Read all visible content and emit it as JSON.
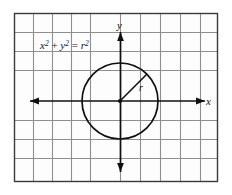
{
  "figure": {
    "background_color": "#fdfdfd",
    "frame": {
      "border_color": "#3a3a3a",
      "x": 14,
      "y": 13,
      "width": 204,
      "height": 169
    },
    "grid": {
      "color": "#8e8e8e",
      "cell_size": 19,
      "columns": 10,
      "rows": 9,
      "visible": true
    },
    "axes": {
      "color": "#101010",
      "x_label": "x",
      "y_label": "y",
      "x_arrow_left": true,
      "x_arrow_right": true,
      "y_arrow_up": true,
      "y_arrow_down": true,
      "origin_x": 120,
      "origin_y": 101
    },
    "equation": {
      "base_x": "x",
      "exp_x": "2",
      "plus": " + ",
      "base_y": "y",
      "exp_y": "2",
      "equals": " = ",
      "base_r": "r",
      "exp_r": "2",
      "full_text": "x2 + y2 = r2"
    },
    "circle": {
      "center_x": 120,
      "center_y": 101,
      "radius": 38,
      "stroke_color": "#101010",
      "fill": "none"
    },
    "radius_segment": {
      "from_x": 120,
      "from_y": 101,
      "to_x": 147,
      "to_y": 74,
      "label": "r",
      "label_x": 139,
      "label_y": 90,
      "color": "#101010"
    }
  }
}
